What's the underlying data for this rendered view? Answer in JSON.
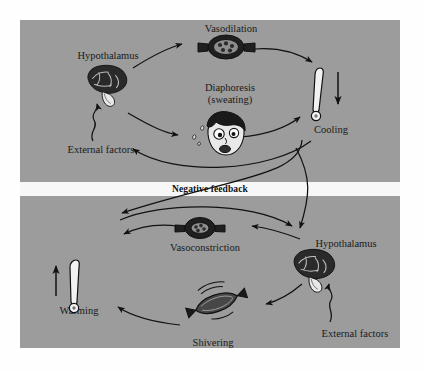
{
  "figure": {
    "background_color": "#fefefe",
    "panel_color": "#9c9c9c",
    "band_color": "#f7f7f7",
    "ink_color": "#1a1a1a"
  },
  "divider": {
    "label": "Negative feedback"
  },
  "panels": [
    {
      "id": "heat-loss",
      "name": "upper-panel",
      "nodes": [
        {
          "id": "hypothalamus-top",
          "label": "Hypothalamus",
          "icon": "brain-icon"
        },
        {
          "id": "vasodilation",
          "label": "Vasodilation",
          "icon": "dilated-vessel-icon"
        },
        {
          "id": "diaphoresis",
          "label": "Diaphoresis\n(sweating)",
          "line1": "Diaphoresis",
          "line2": "(sweating)",
          "icon": "sweating-face-icon"
        },
        {
          "id": "cooling",
          "label": "Cooling",
          "icon": "thermometer-down-icon"
        },
        {
          "id": "external-factors-top",
          "label": "External factors",
          "icon": "squiggle-arrow-icon"
        }
      ]
    },
    {
      "id": "heat-gain",
      "name": "lower-panel",
      "nodes": [
        {
          "id": "hypothalamus-bottom",
          "label": "Hypothalamus",
          "icon": "brain-icon"
        },
        {
          "id": "vasoconstriction",
          "label": "Vasoconstriction",
          "icon": "constricted-vessel-icon"
        },
        {
          "id": "shivering",
          "label": "Shivering",
          "icon": "muscle-icon"
        },
        {
          "id": "warming",
          "label": "Warming",
          "icon": "thermometer-up-icon"
        },
        {
          "id": "external-factors-bottom",
          "label": "External factors",
          "icon": "squiggle-arrow-icon"
        }
      ]
    }
  ]
}
